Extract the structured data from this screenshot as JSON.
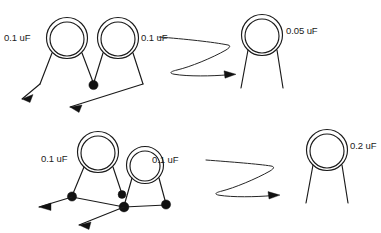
{
  "figure": {
    "type": "hand-drawn-circuit-equivalence-diagram",
    "background_color": "#ffffff",
    "ink_color": "#1a1a1a"
  },
  "rows": [
    {
      "id": "row-top",
      "left_side": {
        "components": [
          {
            "id": "cap-top-left",
            "label": "0.1 uF"
          },
          {
            "id": "cap-top-mid",
            "label": "0.1 uF"
          }
        ],
        "junction_count": 1,
        "lead_arrow_count": 2
      },
      "arrow": {
        "id": "arrow-top",
        "shape": "z-squiggle",
        "direction": "right"
      },
      "right_side": {
        "components": [
          {
            "id": "cap-top-result",
            "label": "0.05 uF"
          }
        ]
      }
    },
    {
      "id": "row-bottom",
      "left_side": {
        "components": [
          {
            "id": "cap-bot-left",
            "label": "0.1 uF"
          },
          {
            "id": "cap-bot-right",
            "label": "0.1 uF"
          }
        ],
        "junction_count": 4,
        "lead_arrow_count": 2
      },
      "arrow": {
        "id": "arrow-bottom",
        "shape": "z-squiggle",
        "direction": "right"
      },
      "right_side": {
        "components": [
          {
            "id": "cap-bot-result",
            "label": "0.2 uF"
          }
        ]
      }
    }
  ],
  "labels": {
    "top_left_cap": "0.1 uF",
    "top_mid_cap": "0.1 uF",
    "top_result_cap": "0.05 uF",
    "bottom_left_cap": "0.1 uF",
    "bottom_right_cap": "0.1 uF",
    "bottom_result_cap": "0.2 uF"
  }
}
